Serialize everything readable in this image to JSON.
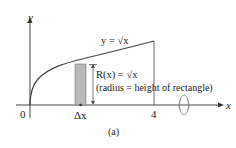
{
  "diagram": {
    "y_axis_label": "y",
    "x_axis_label": "x",
    "origin_label": "0",
    "x_end_label": "4",
    "delta_x_label": "Δx",
    "curve_label": "y = √x",
    "radius_label": "R(x) = √x",
    "radius_note": "(radius = height of rectangle)",
    "caption": "(a)",
    "colors": {
      "curve": "#444444",
      "axes": "#333333",
      "rectangle_fill": "#b8b8b8",
      "rectangle_stroke": "#777777"
    }
  }
}
